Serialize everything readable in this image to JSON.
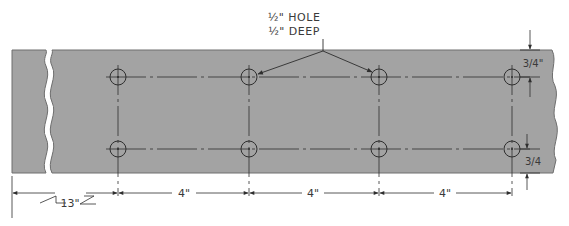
{
  "colors": {
    "plate": "#a3a3a3",
    "plate_edge": "#6e6e6e",
    "line": "#2e2e2e",
    "background": "#ffffff"
  },
  "note": {
    "line1": "½\" HOLE",
    "line2": "½\" DEEP"
  },
  "dimensions": {
    "overall_left": "13\"",
    "spacing": [
      "4\"",
      "4\"",
      "4\""
    ],
    "edge_top": "3/4\"",
    "edge_bottom": "3/4"
  },
  "holes": {
    "columns_x": [
      118,
      249,
      379,
      512
    ],
    "rows_y": [
      77,
      149
    ],
    "count": 8
  }
}
